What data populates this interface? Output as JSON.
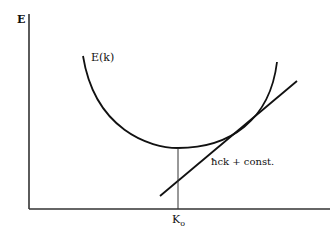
{
  "diagram": {
    "axes": {
      "y_label": "E",
      "x_tick_label": "K",
      "x_tick_subscript": "o"
    },
    "curve": {
      "label": "E(k)",
      "type": "parabola-like band curve with minimum at K_o"
    },
    "tangent": {
      "label": "ħck + const.",
      "description": "straight line tangent to E(k) at large k"
    },
    "colors": {
      "line": "#111111",
      "axis": "#333333",
      "background": "#ffffff"
    }
  }
}
